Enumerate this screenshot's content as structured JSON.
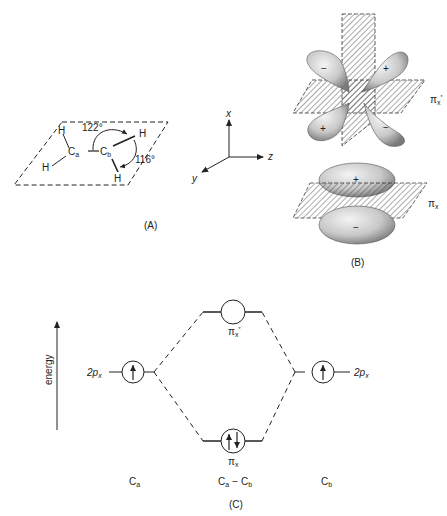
{
  "panelA": {
    "caption": "(A)",
    "atoms": {
      "Ca": "C",
      "Ca_sub": "a",
      "Cb": "C",
      "Cb_sub": "b",
      "H": "H"
    },
    "angles": {
      "HCH_top": "122°",
      "HCH_bottom": "116°"
    }
  },
  "axes": {
    "x": "x",
    "y": "y",
    "z": "z"
  },
  "panelB": {
    "caption": "(B)",
    "antibonding_label": "π",
    "antibonding_sub": "x",
    "antibonding_sup": "*",
    "bonding_label": "π",
    "bonding_sub": "x",
    "signs": {
      "plus": "+",
      "minus": "−"
    }
  },
  "panelC": {
    "caption": "(C)",
    "energy_axis": "energy",
    "left_orbital": {
      "label": "2p",
      "sub": "x",
      "electrons": "↑"
    },
    "right_orbital": {
      "label": "2p",
      "sub": "x",
      "electrons": "↑"
    },
    "antibonding": {
      "label": "π",
      "sub": "x",
      "sup": "*",
      "electrons": ""
    },
    "bonding": {
      "label": "π",
      "sub": "x",
      "electrons": "↑↓"
    },
    "bottom_labels": {
      "left": "C",
      "left_sub": "a",
      "middle_a": "C",
      "middle_a_sub": "a",
      "middle_dash": "−",
      "middle_b": "C",
      "middle_b_sub": "b",
      "right": "C",
      "right_sub": "b"
    }
  }
}
